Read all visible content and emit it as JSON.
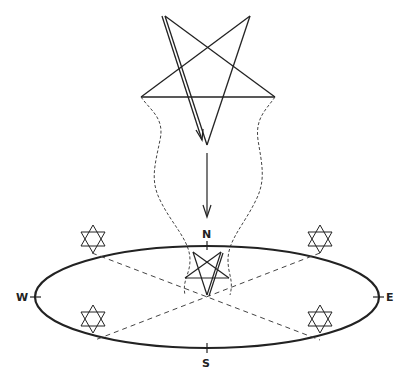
{
  "diagram": {
    "title": "",
    "labels": {
      "north": "N",
      "south": "S",
      "east": "E",
      "west": "W"
    },
    "elements": {
      "large_pentagram": "inverted pentagram descending",
      "small_pentagram": "inverted pentagram at center of circle",
      "hexagrams": [
        "north-west",
        "north-east",
        "south-west",
        "south-east"
      ],
      "circle": "ellipse with quarter marks at N, E, S, W",
      "arrow": "downward arrow from pentagram toward circle"
    },
    "colors": {
      "ink": "#222222",
      "background": "#ffffff"
    }
  }
}
